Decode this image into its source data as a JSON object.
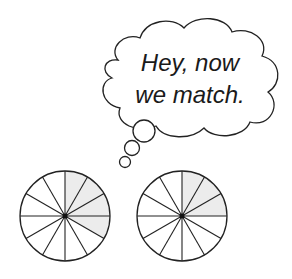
{
  "thought_bubble": {
    "line1": "Hey, now",
    "line2": "we match."
  },
  "circles": [
    {
      "label": "left-fraction-circle",
      "sectors": 12,
      "shaded": 4,
      "fraction": "4/12"
    },
    {
      "label": "right-fraction-circle",
      "sectors": 12,
      "shaded": 3,
      "fraction": "3/12"
    }
  ],
  "colors": {
    "shade": "#ececec",
    "stroke": "#222222"
  }
}
